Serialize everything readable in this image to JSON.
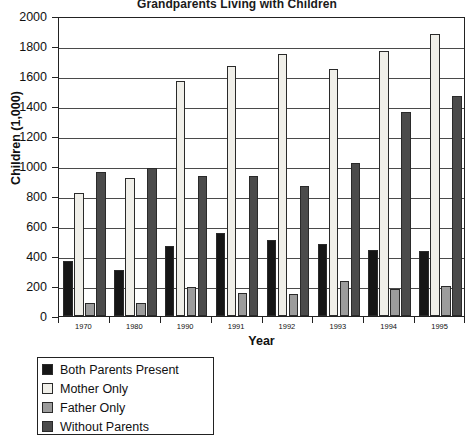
{
  "chart_data": {
    "type": "bar",
    "title": "Grandparents Living with Children",
    "xlabel": "Year",
    "ylabel": "Children (1,000)",
    "categories": [
      "1970",
      "1980",
      "1990",
      "1991",
      "1992",
      "1993",
      "1994",
      "1995"
    ],
    "ylim": [
      0,
      2000
    ],
    "ytick_step": 200,
    "yticks": [
      "2000",
      "1800",
      "1600",
      "1400",
      "1200",
      "1000",
      "800",
      "600",
      "400",
      "200",
      "0"
    ],
    "grid": true,
    "legend_position": "below-left",
    "series": [
      {
        "name": "Both Parents Present",
        "color": "#161616",
        "values": [
          370,
          310,
          470,
          555,
          505,
          480,
          440,
          435
        ]
      },
      {
        "name": "Mother Only",
        "color": "#f0efe9",
        "values": [
          820,
          920,
          1565,
          1670,
          1745,
          1645,
          1765,
          1880
        ]
      },
      {
        "name": "Father Only",
        "color": "#9c9c9c",
        "values": [
          85,
          85,
          195,
          155,
          145,
          235,
          180,
          200
        ]
      },
      {
        "name": "Without Parents",
        "color": "#4b4b4b",
        "values": [
          960,
          985,
          935,
          935,
          870,
          1020,
          1360,
          1465
        ]
      }
    ]
  }
}
